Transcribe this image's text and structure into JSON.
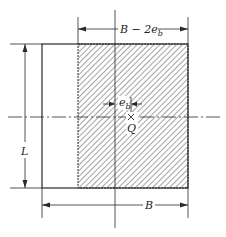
{
  "diagram": {
    "labels": {
      "top_dimension": "B − 2e",
      "top_dimension_sub": "b",
      "eccentricity": "e",
      "eccentricity_sub": "b",
      "load": "Q",
      "length": "L",
      "width": "B"
    },
    "colors": {
      "line": "#2a2a2a",
      "hatch": "#555555",
      "background": "#ffffff"
    }
  }
}
